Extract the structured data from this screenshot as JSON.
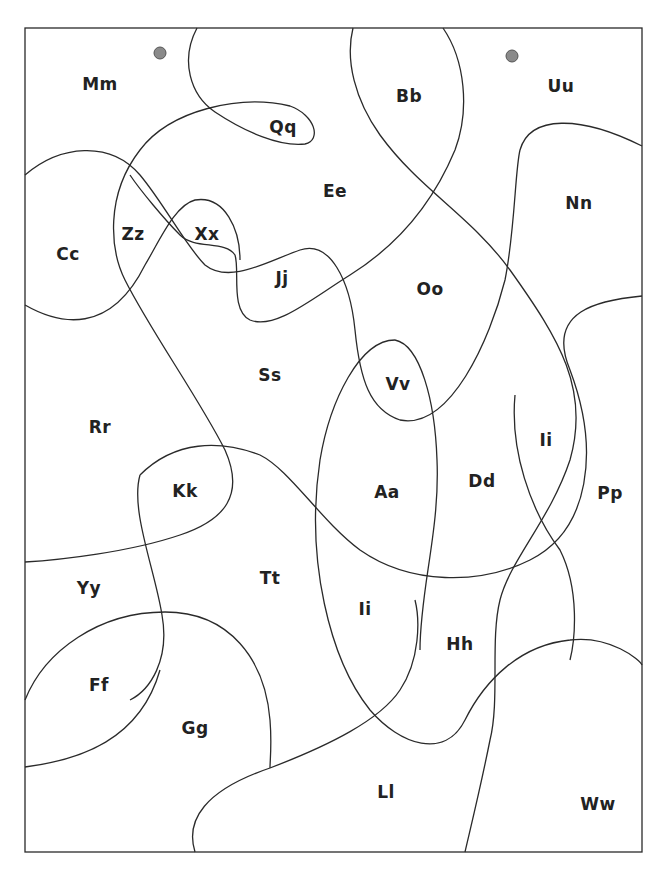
{
  "worksheet": {
    "regions": [
      {
        "id": "mm",
        "label": "Mm",
        "x": 100,
        "y": 84
      },
      {
        "id": "qq",
        "label": "Qq",
        "x": 283,
        "y": 127
      },
      {
        "id": "bb",
        "label": "Bb",
        "x": 409,
        "y": 96
      },
      {
        "id": "uu",
        "label": "Uu",
        "x": 561,
        "y": 86
      },
      {
        "id": "ee",
        "label": "Ee",
        "x": 335,
        "y": 191
      },
      {
        "id": "nn",
        "label": "Nn",
        "x": 579,
        "y": 203
      },
      {
        "id": "cc",
        "label": "Cc",
        "x": 68,
        "y": 254
      },
      {
        "id": "zz",
        "label": "Zz",
        "x": 133,
        "y": 234
      },
      {
        "id": "xx",
        "label": "Xx",
        "x": 207,
        "y": 234
      },
      {
        "id": "jj",
        "label": "Jj",
        "x": 282,
        "y": 278
      },
      {
        "id": "oo",
        "label": "Oo",
        "x": 430,
        "y": 289
      },
      {
        "id": "ss",
        "label": "Ss",
        "x": 270,
        "y": 375
      },
      {
        "id": "vv",
        "label": "Vv",
        "x": 398,
        "y": 384
      },
      {
        "id": "rr",
        "label": "Rr",
        "x": 100,
        "y": 427
      },
      {
        "id": "ii_right",
        "label": "Ii",
        "x": 546,
        "y": 440
      },
      {
        "id": "kk",
        "label": "Kk",
        "x": 185,
        "y": 491
      },
      {
        "id": "aa",
        "label": "Aa",
        "x": 387,
        "y": 492
      },
      {
        "id": "dd",
        "label": "Dd",
        "x": 482,
        "y": 481
      },
      {
        "id": "pp",
        "label": "Pp",
        "x": 610,
        "y": 493
      },
      {
        "id": "tt",
        "label": "Tt",
        "x": 270,
        "y": 578
      },
      {
        "id": "yy",
        "label": "Yy",
        "x": 89,
        "y": 588
      },
      {
        "id": "ii_center",
        "label": "Ii",
        "x": 365,
        "y": 609
      },
      {
        "id": "hh",
        "label": "Hh",
        "x": 460,
        "y": 644
      },
      {
        "id": "ff",
        "label": "Ff",
        "x": 99,
        "y": 685
      },
      {
        "id": "gg",
        "label": "Gg",
        "x": 195,
        "y": 728
      },
      {
        "id": "ll",
        "label": "Ll",
        "x": 386,
        "y": 792
      },
      {
        "id": "ww",
        "label": "Ww",
        "x": 598,
        "y": 804
      }
    ],
    "markers": [
      {
        "id": "start-dot-left",
        "x": 160,
        "y": 53
      },
      {
        "id": "start-dot-right",
        "x": 512,
        "y": 56
      }
    ],
    "colors": {
      "line": "#2a2a2a",
      "text": "#222222",
      "dot": "#8a8a8a",
      "background": "#ffffff"
    }
  }
}
